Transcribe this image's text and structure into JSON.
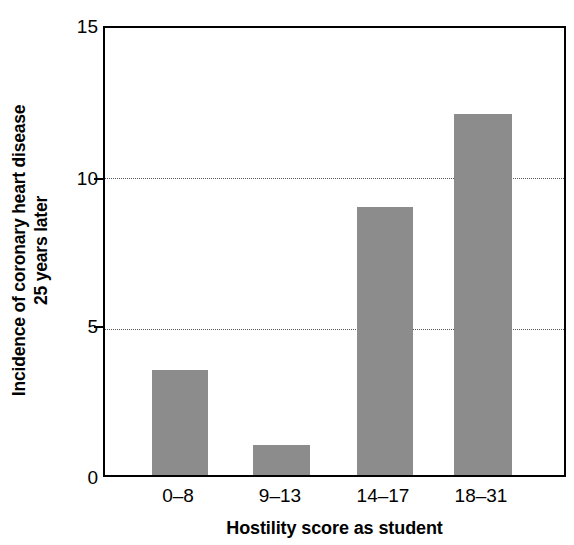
{
  "chart_data": {
    "type": "bar",
    "title": "",
    "categories": [
      "0–8",
      "9–13",
      "14–17",
      "18–31"
    ],
    "values": [
      3.5,
      1.0,
      8.9,
      12.0
    ],
    "xlabel": "Hostility score as student",
    "ylabel_lines": [
      "Incidence of coronary heart disease",
      "25 years later"
    ],
    "ylim": [
      0,
      15
    ],
    "yticks": [
      0,
      5,
      10,
      15
    ],
    "ytick_labels": [
      "0",
      "5",
      "10",
      "15"
    ],
    "gridlines": [
      5,
      10
    ],
    "grid": true,
    "grid_style": "dotted",
    "legend": null,
    "bar_color": "#8c8c8c",
    "axis_color": "#000000",
    "background_color": "#ffffff"
  }
}
